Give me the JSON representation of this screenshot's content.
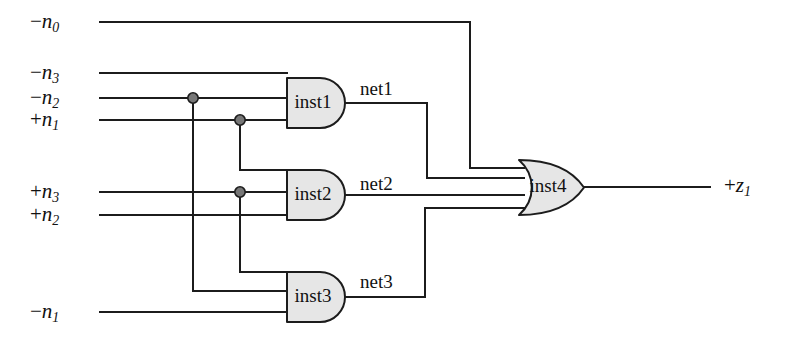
{
  "diagram": {
    "colors": {
      "wire": "#1c1c1c",
      "gate_fill": "#e6e6e6",
      "gate_stroke": "#1c1c1c",
      "junction": "#777777",
      "background": "#ffffff"
    },
    "inputs": [
      {
        "id": "in_n0",
        "sign": "−",
        "name": "n",
        "index": "0",
        "text": "−n0",
        "y": 22
      },
      {
        "id": "in_n3_neg",
        "sign": "−",
        "name": "n",
        "index": "3",
        "text": "−n3",
        "y": 73
      },
      {
        "id": "in_n2_neg",
        "sign": "−",
        "name": "n",
        "index": "2",
        "text": "−n2",
        "y": 98
      },
      {
        "id": "in_n1_pos",
        "sign": "+",
        "name": "n",
        "index": "1",
        "text": "+n1",
        "y": 120
      },
      {
        "id": "in_n3_pos",
        "sign": "+",
        "name": "n",
        "index": "3",
        "text": "+n3",
        "y": 192
      },
      {
        "id": "in_n2_pos",
        "sign": "+",
        "name": "n",
        "index": "2",
        "text": "+n2",
        "y": 215
      },
      {
        "id": "in_n1_neg",
        "sign": "−",
        "name": "n",
        "index": "1",
        "text": "−n1",
        "y": 312
      }
    ],
    "outputs": [
      {
        "id": "out_z1",
        "sign": "+",
        "name": "z",
        "index": "1",
        "text": "+z1",
        "y": 186
      }
    ],
    "gates": [
      {
        "id": "inst1",
        "label": "inst1",
        "type": "and",
        "inputs": 3
      },
      {
        "id": "inst2",
        "label": "inst2",
        "type": "and",
        "inputs": 3
      },
      {
        "id": "inst3",
        "label": "inst3",
        "type": "and",
        "inputs": 3
      },
      {
        "id": "inst4",
        "label": "inst4",
        "type": "or",
        "inputs": 4
      }
    ],
    "nets": [
      {
        "id": "net1",
        "label": "net1",
        "from": "inst1",
        "to": "inst4"
      },
      {
        "id": "net2",
        "label": "net2",
        "from": "inst2",
        "to": "inst4"
      },
      {
        "id": "net3",
        "label": "net3",
        "from": "inst3",
        "to": "inst4"
      }
    ],
    "junctions": [
      {
        "id": "j_n2_neg",
        "x": 193,
        "y": 98
      },
      {
        "id": "j_n1_pos",
        "x": 240,
        "y": 120
      },
      {
        "id": "j_n3_pos",
        "x": 240,
        "y": 192
      }
    ]
  }
}
